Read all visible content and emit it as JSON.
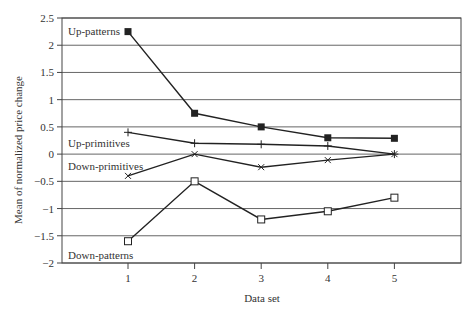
{
  "chart_data": {
    "type": "line",
    "title": "",
    "xlabel": "Data set",
    "ylabel": "Mean of normalized price change",
    "x": [
      1,
      2,
      3,
      4,
      5
    ],
    "x_ticks": [
      "1",
      "2",
      "3",
      "4",
      "5"
    ],
    "y_ticks": [
      "2.5",
      "2",
      "1.5",
      "1",
      "0.5",
      "0",
      "−0.5",
      "−1",
      "−1.5",
      "−2"
    ],
    "y_tick_values": [
      2.5,
      2,
      1.5,
      1,
      0.5,
      0,
      -0.5,
      -1,
      -1.5,
      -2
    ],
    "ylim": [
      -2,
      2.5
    ],
    "xlim": [
      0.7,
      6.0
    ],
    "grid": "horizontal",
    "legend": "inline labels",
    "series": [
      {
        "name": "Up-patterns",
        "marker": "filled-square",
        "values": [
          2.25,
          0.75,
          0.5,
          0.3,
          0.29
        ]
      },
      {
        "name": "Up-primitives",
        "marker": "plus",
        "values": [
          0.4,
          0.2,
          0.18,
          0.15,
          0.0
        ]
      },
      {
        "name": "Down-primitives",
        "marker": "x",
        "values": [
          -0.4,
          0.0,
          -0.24,
          -0.11,
          0.0
        ]
      },
      {
        "name": "Down-patterns",
        "marker": "open-square",
        "values": [
          -1.6,
          -0.5,
          -1.2,
          -1.05,
          -0.8
        ]
      }
    ],
    "annotations": [
      {
        "text": "Up-patterns",
        "x_px": 68,
        "y_px": 35
      },
      {
        "text": "Up-primitives",
        "x_px": 68,
        "y_px": 147
      },
      {
        "text": "Down-primitives",
        "x_px": 68,
        "y_px": 170
      },
      {
        "text": "Down-patterns",
        "x_px": 68,
        "y_px": 259
      }
    ]
  }
}
